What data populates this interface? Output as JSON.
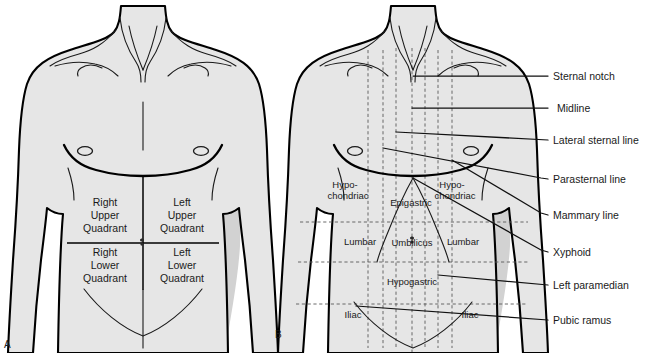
{
  "figure": {
    "type": "anatomy-diagram",
    "background_color": "#ffffff",
    "body_fill_color": "#e6e6e6",
    "body_shadow_color": "#d2d2d2",
    "outline_color": "#000000",
    "dashed_line_color": "#5a5a5a"
  },
  "panels": [
    {
      "letter": "A",
      "name": "abdominal-quadrants",
      "labels": [
        {
          "id": "ruq",
          "lines": [
            "Right",
            "Upper",
            "Quadrant"
          ]
        },
        {
          "id": "luq",
          "lines": [
            "Left",
            "Upper",
            "Quadrant"
          ]
        },
        {
          "id": "rlq",
          "lines": [
            "Right",
            "Lower",
            "Quadrant"
          ]
        },
        {
          "id": "llq",
          "lines": [
            "Left",
            "Lower",
            "Quadrant"
          ]
        }
      ]
    },
    {
      "letter": "B",
      "name": "abdominal-regions",
      "region_labels": [
        {
          "id": "hypochondriac-right",
          "lines": [
            "Hypo-",
            "chondriac"
          ]
        },
        {
          "id": "hypochondriac-left",
          "lines": [
            "Hypo-",
            "chondriac"
          ]
        },
        {
          "id": "epigastric",
          "lines": [
            "Epigastric"
          ]
        },
        {
          "id": "lumbar-right",
          "lines": [
            "Lumbar"
          ]
        },
        {
          "id": "umbilicus",
          "lines": [
            "Umbilicus"
          ]
        },
        {
          "id": "lumbar-left",
          "lines": [
            "Lumbar"
          ]
        },
        {
          "id": "hypogastric",
          "lines": [
            "Hypogastric"
          ]
        },
        {
          "id": "iliac-right",
          "lines": [
            "Iliac"
          ]
        },
        {
          "id": "iliac-left",
          "lines": [
            "Iliac"
          ]
        }
      ],
      "callouts": [
        {
          "id": "sternal-notch",
          "label": "Sternal notch"
        },
        {
          "id": "midline",
          "label": "Midline"
        },
        {
          "id": "lateral-sternal-line",
          "label": "Lateral sternal line"
        },
        {
          "id": "parasternal-line",
          "label": "Parasternal line"
        },
        {
          "id": "mammary-line",
          "label": "Mammary line"
        },
        {
          "id": "xyphoid",
          "label": "Xyphoid"
        },
        {
          "id": "left-paramedian",
          "label": "Left paramedian"
        },
        {
          "id": "pubic-ramus",
          "label": "Pubic ramus"
        }
      ]
    }
  ]
}
